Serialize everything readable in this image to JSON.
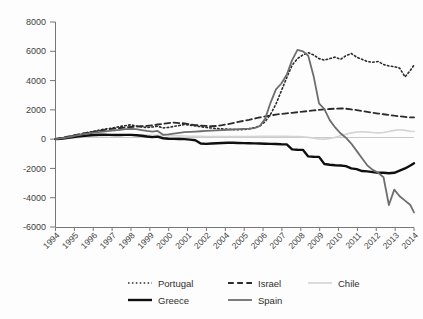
{
  "chart_data": {
    "type": "line",
    "title": "",
    "subtitle": "",
    "xlabel": "",
    "ylabel": "",
    "ylim": [
      -6000,
      8000
    ],
    "yticks": [
      -6000,
      -4000,
      -2000,
      0,
      2000,
      4000,
      6000,
      8000
    ],
    "ytick_labels": [
      "-6000",
      "-4000",
      "-2000",
      "0",
      "2000",
      "4000",
      "6000",
      "8000"
    ],
    "xlim": [
      1994,
      2014
    ],
    "xtick_labels": [
      "1994",
      "1995",
      "1996",
      "1997",
      "1998",
      "1999",
      "2000",
      "2001",
      "2002",
      "2004",
      "2005",
      "2006",
      "2007",
      "2008",
      "2009",
      "2010",
      "2011",
      "2012",
      "2013",
      "2014"
    ],
    "grid": false,
    "legend_position": "bottom",
    "x": [
      1994.0,
      1994.3,
      1994.6,
      1994.9,
      1995.2,
      1995.5,
      1995.8,
      1996.1,
      1996.4,
      1996.7,
      1997.0,
      1997.3,
      1997.6,
      1997.9,
      1998.2,
      1998.5,
      1998.8,
      1999.1,
      1999.4,
      1999.7,
      2000.0,
      2000.3,
      2000.6,
      2000.9,
      2001.2,
      2001.5,
      2001.8,
      2002.1,
      2002.4,
      2002.7,
      2003.0,
      2003.3,
      2003.6,
      2003.9,
      2004.2,
      2004.5,
      2004.8,
      2005.1,
      2005.4,
      2005.7,
      2006.0,
      2006.3,
      2006.6,
      2006.9,
      2007.2,
      2007.5,
      2007.8,
      2008.1,
      2008.4,
      2008.7,
      2009.0,
      2009.3,
      2009.6,
      2009.9,
      2010.2,
      2010.5,
      2010.8,
      2011.1,
      2011.4,
      2011.7,
      2012.0,
      2012.3,
      2012.6,
      2012.9,
      2013.2,
      2013.5,
      2013.8,
      2014.0
    ],
    "series": [
      {
        "name": "Portugal",
        "style": "dotted",
        "color": "#2b2b2b",
        "width": 1.6,
        "values": [
          0,
          60,
          130,
          210,
          290,
          370,
          450,
          520,
          600,
          680,
          730,
          790,
          860,
          920,
          980,
          900,
          840,
          790,
          830,
          880,
          760,
          800,
          870,
          930,
          1000,
          960,
          900,
          850,
          800,
          760,
          720,
          700,
          680,
          660,
          640,
          660,
          700,
          780,
          900,
          1200,
          1700,
          2400,
          3300,
          4200,
          5050,
          5500,
          5750,
          5900,
          5750,
          5500,
          5400,
          5500,
          5600,
          5450,
          5700,
          5850,
          5600,
          5450,
          5300,
          5250,
          5300,
          5100,
          5000,
          4950,
          4850,
          4250,
          4700,
          5050
        ]
      },
      {
        "name": "Israel",
        "style": "dashed",
        "color": "#2b2b2b",
        "width": 1.8,
        "values": [
          0,
          70,
          150,
          230,
          300,
          380,
          440,
          500,
          560,
          620,
          680,
          720,
          760,
          800,
          830,
          860,
          880,
          900,
          950,
          1000,
          1050,
          1100,
          1130,
          1100,
          1080,
          1000,
          960,
          930,
          900,
          880,
          900,
          950,
          1020,
          1100,
          1180,
          1250,
          1320,
          1400,
          1480,
          1550,
          1620,
          1680,
          1720,
          1760,
          1800,
          1840,
          1880,
          1920,
          1960,
          2000,
          2030,
          2060,
          2080,
          2100,
          2080,
          2030,
          1980,
          1920,
          1860,
          1800,
          1750,
          1700,
          1650,
          1600,
          1560,
          1520,
          1480,
          1480
        ]
      },
      {
        "name": "Chile",
        "style": "solid",
        "color": "#d4d4d4",
        "width": 1.6,
        "values": [
          0,
          20,
          45,
          70,
          100,
          130,
          160,
          190,
          210,
          230,
          250,
          270,
          290,
          300,
          310,
          300,
          290,
          280,
          270,
          260,
          250,
          240,
          230,
          220,
          210,
          200,
          195,
          190,
          185,
          180,
          175,
          170,
          170,
          170,
          170,
          175,
          180,
          185,
          190,
          195,
          200,
          200,
          195,
          190,
          185,
          180,
          160,
          120,
          70,
          20,
          0,
          40,
          120,
          230,
          340,
          430,
          480,
          500,
          480,
          450,
          430,
          450,
          520,
          600,
          640,
          600,
          540,
          520
        ]
      },
      {
        "name": "Greece",
        "style": "solid",
        "color": "#0f0f0f",
        "width": 2.4,
        "values": [
          0,
          30,
          70,
          120,
          170,
          210,
          250,
          280,
          300,
          300,
          290,
          280,
          280,
          290,
          290,
          270,
          230,
          180,
          140,
          170,
          60,
          30,
          20,
          10,
          0,
          -30,
          -80,
          -300,
          -320,
          -300,
          -280,
          -260,
          -250,
          -250,
          -260,
          -270,
          -280,
          -290,
          -300,
          -310,
          -320,
          -330,
          -350,
          -360,
          -700,
          -720,
          -730,
          -1180,
          -1200,
          -1210,
          -1700,
          -1750,
          -1780,
          -1800,
          -1840,
          -2000,
          -2050,
          -2180,
          -2200,
          -2250,
          -2300,
          -2300,
          -2330,
          -2300,
          -2150,
          -2000,
          -1800,
          -1650
        ]
      },
      {
        "name": "Spain",
        "style": "solid",
        "color": "#6e6e6e",
        "width": 1.8,
        "values": [
          0,
          50,
          110,
          180,
          250,
          320,
          380,
          430,
          480,
          520,
          560,
          600,
          640,
          680,
          700,
          680,
          620,
          560,
          520,
          560,
          300,
          330,
          380,
          430,
          480,
          500,
          520,
          540,
          560,
          580,
          600,
          620,
          640,
          660,
          680,
          700,
          720,
          750,
          900,
          1400,
          2500,
          3400,
          3800,
          4400,
          5400,
          6100,
          6000,
          5700,
          4300,
          2450,
          2050,
          1300,
          800,
          400,
          100,
          -300,
          -800,
          -1300,
          -1800,
          -2100,
          -2300,
          -2600,
          -4500,
          -3450,
          -3900,
          -4200,
          -4500,
          -5000
        ]
      }
    ]
  },
  "legend": {
    "items": [
      {
        "label": "Portugal",
        "style": "dotted",
        "color": "#2b2b2b"
      },
      {
        "label": "Israel",
        "style": "dashed",
        "color": "#2b2b2b"
      },
      {
        "label": "Chile",
        "style": "solid",
        "color": "#d4d4d4"
      },
      {
        "label": "Greece",
        "style": "solid",
        "color": "#0f0f0f"
      },
      {
        "label": "Spain",
        "style": "solid",
        "color": "#6e6e6e"
      }
    ]
  },
  "colors": {
    "axis": "#777777",
    "zero_line": "#c9c9c9",
    "text": "#3a3a3a",
    "background": "#fdfdfd"
  }
}
